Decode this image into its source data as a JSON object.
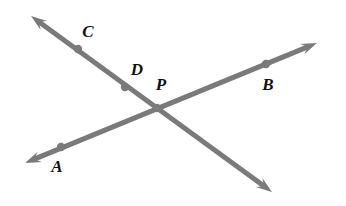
{
  "figure": {
    "kind": "geometry-diagram",
    "background_color": "#ffffff",
    "line_color": "#7a7a7a",
    "dot_color": "#7a7a7a",
    "label_color": "#111111",
    "label_font_size_px": 17,
    "line_width_px": 5,
    "dot_radius_px": 4.2,
    "canvas": {
      "width": 346,
      "height": 206
    }
  },
  "lines": [
    {
      "id": "line-apb",
      "name": "line-through-A-P-B",
      "start": {
        "x": 25,
        "y": 163
      },
      "end": {
        "x": 317,
        "y": 43
      },
      "arrow_start": true,
      "arrow_end": true
    },
    {
      "id": "line-cdp",
      "name": "line-through-C-D-P",
      "start": {
        "x": 31,
        "y": 16
      },
      "end": {
        "x": 272,
        "y": 192
      },
      "arrow_start": true,
      "arrow_end": true
    }
  ],
  "points": [
    {
      "id": "point-c",
      "label": "C",
      "dot": {
        "x": 78,
        "y": 49
      },
      "label_pos": {
        "x": 88,
        "y": 31
      }
    },
    {
      "id": "point-d",
      "label": "D",
      "dot": {
        "x": 125,
        "y": 87
      },
      "label_pos": {
        "x": 137,
        "y": 69
      }
    },
    {
      "id": "point-p",
      "label": "P",
      "dot": {
        "x": 157,
        "y": 108
      },
      "label_pos": {
        "x": 161,
        "y": 84
      }
    },
    {
      "id": "point-b",
      "label": "B",
      "dot": {
        "x": 266,
        "y": 64
      },
      "label_pos": {
        "x": 268,
        "y": 84
      }
    },
    {
      "id": "point-a",
      "label": "A",
      "dot": {
        "x": 61,
        "y": 147
      },
      "label_pos": {
        "x": 57,
        "y": 166
      }
    }
  ]
}
